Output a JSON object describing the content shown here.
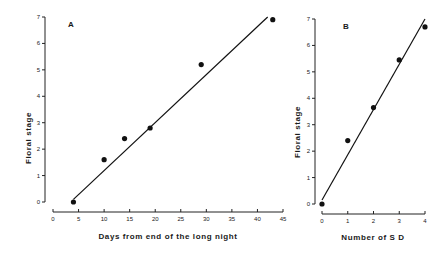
{
  "chart_data": [
    {
      "type": "scatter",
      "panel_label": "A",
      "title": "",
      "xlabel": "Days from end of the long night",
      "ylabel": "Floral stage",
      "xlim": [
        0,
        45
      ],
      "ylim": [
        0,
        7
      ],
      "x_ticks": [
        0,
        5,
        10,
        15,
        20,
        25,
        30,
        35,
        40,
        45
      ],
      "y_ticks": [
        0,
        1,
        2,
        3,
        4,
        5,
        6,
        7
      ],
      "grid": false,
      "legend": null,
      "series": [
        {
          "name": "observed",
          "x": [
            4,
            10,
            14,
            19,
            29,
            43
          ],
          "y": [
            0,
            1.6,
            2.4,
            2.8,
            5.2,
            6.9
          ]
        }
      ],
      "fit_line": {
        "x": [
          4,
          42
        ],
        "y": [
          0.1,
          7.0
        ]
      }
    },
    {
      "type": "scatter",
      "panel_label": "B",
      "title": "",
      "xlabel": "Number of S D",
      "ylabel": "Floral stage",
      "xlim": [
        0,
        4
      ],
      "ylim": [
        0,
        7
      ],
      "x_ticks": [
        0,
        1,
        2,
        3,
        4
      ],
      "y_ticks": [
        0,
        1,
        2,
        3,
        4,
        5,
        6,
        7
      ],
      "grid": false,
      "legend": null,
      "series": [
        {
          "name": "observed",
          "x": [
            0,
            1,
            2,
            3,
            4
          ],
          "y": [
            0,
            2.4,
            3.65,
            5.45,
            6.7
          ]
        }
      ],
      "fit_line": {
        "x": [
          0,
          4
        ],
        "y": [
          0.15,
          7.0
        ]
      }
    }
  ],
  "layout": {
    "panels": [
      {
        "yaxis_x": 45,
        "y_top": 17,
        "y_bottom": 202,
        "xaxis_y": 212,
        "x_left": 53,
        "x_right": 283,
        "label_pos": [
          68,
          27
        ],
        "xlabel_pos": [
          168,
          239
        ],
        "ylabel_pos": [
          31,
          138
        ]
      },
      {
        "yaxis_x": 315,
        "y_top": 19,
        "y_bottom": 204,
        "xaxis_y": 214,
        "x_left": 322,
        "x_right": 425,
        "label_pos": [
          343,
          29
        ],
        "xlabel_pos": [
          373,
          240
        ],
        "ylabel_pos": [
          300,
          132
        ]
      }
    ]
  },
  "colors": {
    "ink": "#111111",
    "background": "#ffffff"
  }
}
